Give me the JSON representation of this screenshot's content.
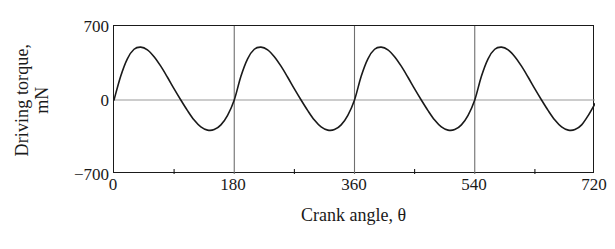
{
  "chart_data": {
    "type": "line",
    "title": "",
    "subtitle": "",
    "xlabel": "Crank angle, θ",
    "ylabel": "Driving torque, mN",
    "ylabel_line1": "Driving torque,",
    "ylabel_line2": "mN",
    "xlim": [
      0,
      720
    ],
    "ylim": [
      -700,
      700
    ],
    "xticks": [
      0,
      180,
      360,
      540,
      720
    ],
    "xtick_labels": [
      "0",
      "180",
      "360",
      "540",
      "720"
    ],
    "yticks": [
      -700,
      0,
      700
    ],
    "ytick_labels": [
      "700",
      "0",
      "−700"
    ],
    "grid": "vertical gridlines at 180, 360, 540; horizontal gridline at y = 0",
    "gridlines_x": [
      180,
      360,
      540
    ],
    "gridlines_y": [
      0
    ],
    "legend": "none",
    "legend_position": "none",
    "line_color": "#1a1a1a",
    "grid_color": "#9a9a9a",
    "axis_color": "#1a1a1a",
    "background_color": "#ffffff",
    "period_degrees": 180,
    "cycles": 4,
    "peak_value": 500,
    "trough_value": -285,
    "peak_at_degrees": [
      40,
      220,
      400,
      580
    ],
    "trough_at_degrees": [
      130,
      310,
      490,
      670
    ],
    "series": [
      {
        "name": "Driving torque",
        "x": [
          0,
          10,
          20,
          30,
          40,
          50,
          60,
          70,
          80,
          90,
          100,
          110,
          120,
          130,
          140,
          150,
          160,
          170,
          180,
          190,
          200,
          210,
          220,
          230,
          240,
          250,
          260,
          270,
          280,
          290,
          300,
          310,
          320,
          330,
          340,
          350,
          360,
          370,
          380,
          390,
          400,
          410,
          420,
          430,
          440,
          450,
          460,
          470,
          480,
          490,
          500,
          510,
          520,
          530,
          540,
          550,
          560,
          570,
          580,
          590,
          600,
          610,
          620,
          630,
          640,
          650,
          660,
          670,
          680,
          690,
          700,
          710,
          720
        ],
        "values": [
          0,
          225,
          390,
          480,
          500,
          475,
          410,
          320,
          215,
          105,
          0,
          -100,
          -190,
          -255,
          -285,
          -280,
          -235,
          -145,
          0,
          225,
          390,
          480,
          500,
          475,
          410,
          320,
          215,
          105,
          0,
          -100,
          -190,
          -255,
          -285,
          -280,
          -235,
          -145,
          0,
          225,
          390,
          480,
          500,
          475,
          410,
          320,
          215,
          105,
          0,
          -100,
          -190,
          -255,
          -285,
          -280,
          -235,
          -145,
          0,
          225,
          390,
          480,
          500,
          475,
          410,
          320,
          215,
          105,
          0,
          -100,
          -190,
          -255,
          -285,
          -280,
          -235,
          -145,
          -35
        ]
      }
    ]
  }
}
